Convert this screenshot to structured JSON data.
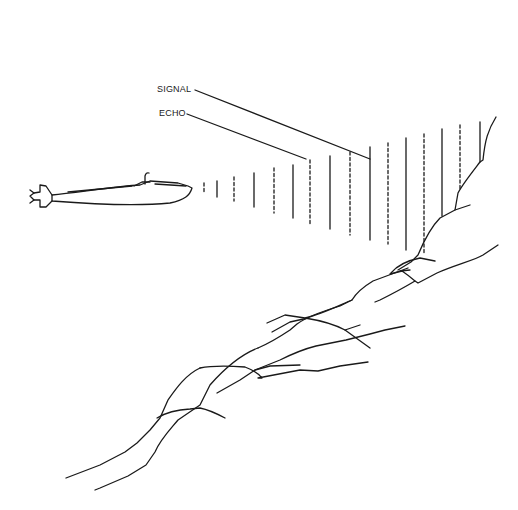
{
  "diagram": {
    "title": "",
    "labels": {
      "signal": "SIGNAL",
      "echo": "ECHO"
    },
    "colors": {
      "ink": "#1a1a1a",
      "background": "#ffffff"
    },
    "pulses": [
      {
        "type": "echo",
        "x": 204,
        "y1": 183,
        "y2": 194
      },
      {
        "type": "signal",
        "x": 217,
        "y1": 181,
        "y2": 197
      },
      {
        "type": "echo",
        "x": 234,
        "y1": 177,
        "y2": 201
      },
      {
        "type": "signal",
        "x": 254,
        "y1": 173,
        "y2": 207
      },
      {
        "type": "echo",
        "x": 274,
        "y1": 168,
        "y2": 213
      },
      {
        "type": "signal",
        "x": 293,
        "y1": 165,
        "y2": 218
      },
      {
        "type": "echo",
        "x": 310,
        "y1": 160,
        "y2": 224
      },
      {
        "type": "signal",
        "x": 330,
        "y1": 156,
        "y2": 229
      },
      {
        "type": "echo",
        "x": 350,
        "y1": 152,
        "y2": 235
      },
      {
        "type": "signal",
        "x": 370,
        "y1": 147,
        "y2": 240
      },
      {
        "type": "echo",
        "x": 388,
        "y1": 143,
        "y2": 244
      },
      {
        "type": "signal",
        "x": 406,
        "y1": 138,
        "y2": 250
      },
      {
        "type": "echo",
        "x": 424,
        "y1": 134,
        "y2": 253
      },
      {
        "type": "signal",
        "x": 442,
        "y1": 129,
        "y2": 216
      },
      {
        "type": "echo",
        "x": 460,
        "y1": 125,
        "y2": 190
      },
      {
        "type": "signal",
        "x": 480,
        "y1": 122,
        "y2": 162
      }
    ]
  }
}
